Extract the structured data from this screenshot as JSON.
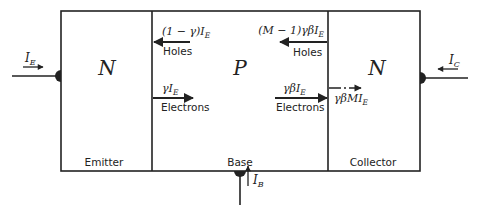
{
  "regions": [
    {
      "letter": "N",
      "label": "Emitter"
    },
    {
      "letter": "P",
      "label": "Base"
    },
    {
      "letter": "N",
      "label": "Collector"
    }
  ],
  "terminals": {
    "emitter": {
      "symbol": "I",
      "sub": "E"
    },
    "collector": {
      "symbol": "I",
      "sub": "C"
    },
    "base": {
      "symbol": "I",
      "sub": "B"
    }
  },
  "flows": {
    "eb_holes": {
      "formula_main": "(1 − γ)I",
      "formula_sub": "E",
      "carrier": "Holes"
    },
    "eb_electrons": {
      "formula_main": "γI",
      "formula_sub": "E",
      "carrier": "Electrons"
    },
    "bc_holes": {
      "formula_main": "(M − 1)γβI",
      "formula_sub": "E",
      "carrier": "Holes"
    },
    "bc_electrons": {
      "formula_main": "γβI",
      "formula_sub": "E",
      "carrier": "Electrons"
    },
    "collector_multiplied": {
      "formula_main": "γβMI",
      "formula_sub": "E"
    }
  },
  "colors": {
    "stroke": "#222222",
    "background": "#ffffff"
  }
}
